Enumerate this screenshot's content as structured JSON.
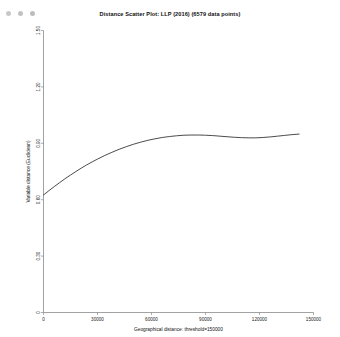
{
  "window": {
    "controls": [
      {
        "name": "close-button",
        "color": "#c8c8c8"
      },
      {
        "name": "minimize-button",
        "color": "#c2c2c2"
      },
      {
        "name": "zoom-button",
        "color": "#bdbdbd"
      }
    ]
  },
  "chart_data": {
    "type": "line",
    "title": "Distance Scatter Plot: LLP (2016) (6579 data points)",
    "xlabel": "Geographical distance: threshold=150000",
    "ylabel": "Variable distance (Euclidean)",
    "xlim": [
      0,
      150000
    ],
    "ylim": [
      0,
      1.5
    ],
    "grid": false,
    "legend": null,
    "xticks": [
      0,
      30000,
      60000,
      90000,
      120000,
      150000
    ],
    "xtick_labels": [
      "0",
      "30000",
      "60000",
      "90000",
      "120000",
      "150000"
    ],
    "yticks": [
      0,
      0.3,
      0.6,
      0.9,
      1.2,
      1.5
    ],
    "ytick_labels": [
      "0",
      "0.30",
      "0.60",
      "0.90",
      "1.20",
      "1.50"
    ],
    "series": [
      {
        "name": "fitted-distance-curve",
        "color": "#2b2b2b",
        "x": [
          0,
          3000,
          6000,
          9000,
          12000,
          15000,
          18000,
          21000,
          24000,
          27000,
          30000,
          34000,
          38000,
          42000,
          46000,
          50000,
          54000,
          58000,
          62000,
          66000,
          70000,
          74000,
          78000,
          82000,
          86000,
          90000,
          94000,
          98000,
          102000,
          106000,
          110000,
          114000,
          118000,
          122000,
          126000,
          130000,
          134000,
          138000,
          142000
        ],
        "y": [
          0.625,
          0.648,
          0.67,
          0.691,
          0.712,
          0.731,
          0.75,
          0.768,
          0.785,
          0.801,
          0.816,
          0.835,
          0.852,
          0.868,
          0.882,
          0.895,
          0.906,
          0.916,
          0.924,
          0.931,
          0.936,
          0.94,
          0.943,
          0.944,
          0.944,
          0.943,
          0.941,
          0.938,
          0.935,
          0.932,
          0.93,
          0.929,
          0.929,
          0.931,
          0.934,
          0.938,
          0.942,
          0.946,
          0.949
        ]
      }
    ]
  }
}
